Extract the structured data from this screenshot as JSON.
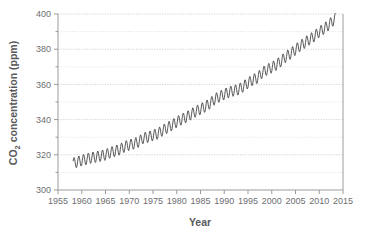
{
  "chart_data": {
    "type": "line",
    "title": "",
    "xlabel": "Year",
    "ylabel": "CO2 concentration (ppm)",
    "ylabel_parts": {
      "pre": "CO",
      "sub": "2",
      "post": " concentration (ppm)"
    },
    "xlim": [
      1955,
      2015
    ],
    "ylim": [
      300,
      400
    ],
    "xticks": [
      1955,
      1960,
      1965,
      1970,
      1975,
      1980,
      1985,
      1990,
      1995,
      2000,
      2005,
      2010,
      2015
    ],
    "xticklabels": [
      "1955",
      "1960",
      "1965",
      "1970",
      "1975",
      "1980",
      "1985",
      "1990",
      "1995",
      "2000",
      "2005",
      "2010",
      "2015"
    ],
    "yticks": [
      300,
      320,
      340,
      360,
      380,
      400
    ],
    "yticklabels": [
      "300",
      "320",
      "340",
      "360",
      "380",
      "400"
    ],
    "y_minor_gridlines": [
      310,
      330,
      350,
      370,
      390
    ],
    "grid": true,
    "legend": "none",
    "series": [
      {
        "name": "Monthly mean CO2 concentration (Mauna Loa)",
        "color": "#3a3a3c",
        "x_start": 1958.2,
        "x_end": 2013.4,
        "samples_per_year": 12,
        "seasonal_amplitude_ppm": 3.1,
        "seasonal_peak_month": 5,
        "annual_trend_points": [
          {
            "year": 1958,
            "value": 315.0
          },
          {
            "year": 1959,
            "value": 315.9
          },
          {
            "year": 1960,
            "value": 316.8
          },
          {
            "year": 1961,
            "value": 317.5
          },
          {
            "year": 1962,
            "value": 318.3
          },
          {
            "year": 1963,
            "value": 318.8
          },
          {
            "year": 1964,
            "value": 319.4
          },
          {
            "year": 1965,
            "value": 320.0
          },
          {
            "year": 1966,
            "value": 321.3
          },
          {
            "year": 1967,
            "value": 322.1
          },
          {
            "year": 1968,
            "value": 323.0
          },
          {
            "year": 1969,
            "value": 324.6
          },
          {
            "year": 1970,
            "value": 325.6
          },
          {
            "year": 1971,
            "value": 326.3
          },
          {
            "year": 1972,
            "value": 327.4
          },
          {
            "year": 1973,
            "value": 329.6
          },
          {
            "year": 1974,
            "value": 330.1
          },
          {
            "year": 1975,
            "value": 331.1
          },
          {
            "year": 1976,
            "value": 332.0
          },
          {
            "year": 1977,
            "value": 333.8
          },
          {
            "year": 1978,
            "value": 335.4
          },
          {
            "year": 1979,
            "value": 336.8
          },
          {
            "year": 1980,
            "value": 338.7
          },
          {
            "year": 1981,
            "value": 340.1
          },
          {
            "year": 1982,
            "value": 341.4
          },
          {
            "year": 1983,
            "value": 343.0
          },
          {
            "year": 1984,
            "value": 344.6
          },
          {
            "year": 1985,
            "value": 346.0
          },
          {
            "year": 1986,
            "value": 347.4
          },
          {
            "year": 1987,
            "value": 349.2
          },
          {
            "year": 1988,
            "value": 351.6
          },
          {
            "year": 1989,
            "value": 353.1
          },
          {
            "year": 1990,
            "value": 354.4
          },
          {
            "year": 1991,
            "value": 355.6
          },
          {
            "year": 1992,
            "value": 356.4
          },
          {
            "year": 1993,
            "value": 357.1
          },
          {
            "year": 1994,
            "value": 358.8
          },
          {
            "year": 1995,
            "value": 360.8
          },
          {
            "year": 1996,
            "value": 362.6
          },
          {
            "year": 1997,
            "value": 363.7
          },
          {
            "year": 1998,
            "value": 366.7
          },
          {
            "year": 1999,
            "value": 368.4
          },
          {
            "year": 2000,
            "value": 369.6
          },
          {
            "year": 2001,
            "value": 371.2
          },
          {
            "year": 2002,
            "value": 373.3
          },
          {
            "year": 2003,
            "value": 375.8
          },
          {
            "year": 2004,
            "value": 377.5
          },
          {
            "year": 2005,
            "value": 379.8
          },
          {
            "year": 2006,
            "value": 381.9
          },
          {
            "year": 2007,
            "value": 383.8
          },
          {
            "year": 2008,
            "value": 385.6
          },
          {
            "year": 2009,
            "value": 387.4
          },
          {
            "year": 2010,
            "value": 389.9
          },
          {
            "year": 2011,
            "value": 391.6
          },
          {
            "year": 2012,
            "value": 393.8
          },
          {
            "year": 2013,
            "value": 396.5
          },
          {
            "year": 2014,
            "value": 398.6
          }
        ]
      }
    ]
  },
  "colors": {
    "background": "#ffffff",
    "line": "#3a3a3c",
    "axis": "#9a9b9d",
    "grid_major": "#c8c9cb",
    "grid_minor": "#d8d9db",
    "text": "#58595b"
  }
}
